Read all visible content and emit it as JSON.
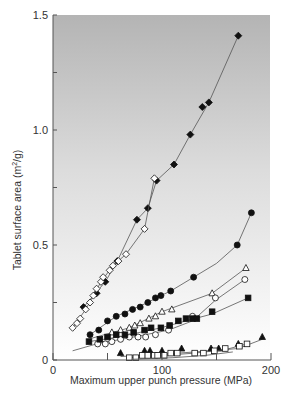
{
  "chart_data": {
    "type": "line",
    "title": "",
    "xlabel": "Maximum upper punch pressure (MPa)",
    "ylabel": "Tablet surface area (m2/g)",
    "ylabel_superscript": "2",
    "xlim": [
      0,
      200
    ],
    "ylim": [
      0,
      1.5
    ],
    "x_ticks": [
      0,
      100,
      200
    ],
    "x_minor_ticks": [
      50,
      150
    ],
    "y_ticks": [
      0,
      0.5,
      1.0,
      1.5
    ],
    "y_tick_labels": [
      "0",
      "0.5",
      "1.0",
      "1.5"
    ],
    "y_minor_ticks": [
      0.25,
      0.75,
      1.25
    ],
    "grid": false,
    "legend": null,
    "background": {
      "top": "#b4b4b4",
      "bottom": "#ffffff"
    },
    "series": [
      {
        "name": "filled-diamond",
        "marker": "diamond-filled",
        "points": [
          [
            28,
            0.23
          ],
          [
            40,
            0.29
          ],
          [
            48,
            0.34
          ],
          [
            59,
            0.43
          ],
          [
            77,
            0.61
          ],
          [
            87,
            0.66
          ],
          [
            95,
            0.78
          ],
          [
            111,
            0.85
          ],
          [
            126,
            0.98
          ],
          [
            137,
            1.1
          ],
          [
            143,
            1.12
          ],
          [
            170,
            1.41
          ]
        ],
        "line": [
          [
            28,
            0.23
          ],
          [
            48,
            0.34
          ],
          [
            59,
            0.43
          ],
          [
            77,
            0.61
          ],
          [
            87,
            0.66
          ],
          [
            95,
            0.78
          ],
          [
            111,
            0.85
          ],
          [
            126,
            0.98
          ],
          [
            143,
            1.12
          ],
          [
            170,
            1.41
          ]
        ]
      },
      {
        "name": "open-diamond",
        "marker": "diamond-open",
        "points": [
          [
            18,
            0.14
          ],
          [
            22,
            0.16
          ],
          [
            25,
            0.18
          ],
          [
            30,
            0.22
          ],
          [
            34,
            0.25
          ],
          [
            37,
            0.28
          ],
          [
            40,
            0.31
          ],
          [
            44,
            0.34
          ],
          [
            46,
            0.36
          ],
          [
            52,
            0.39
          ],
          [
            55,
            0.41
          ],
          [
            60,
            0.43
          ],
          [
            67,
            0.46
          ],
          [
            84,
            0.57
          ],
          [
            93,
            0.79
          ]
        ],
        "line": [
          [
            18,
            0.14
          ],
          [
            30,
            0.22
          ],
          [
            44,
            0.34
          ],
          [
            55,
            0.41
          ],
          [
            67,
            0.46
          ],
          [
            84,
            0.57
          ],
          [
            93,
            0.79
          ]
        ]
      },
      {
        "name": "filled-circle",
        "marker": "circle-filled",
        "points": [
          [
            34,
            0.11
          ],
          [
            42,
            0.13
          ],
          [
            50,
            0.17
          ],
          [
            58,
            0.19
          ],
          [
            66,
            0.2
          ],
          [
            73,
            0.22
          ],
          [
            80,
            0.23
          ],
          [
            87,
            0.25
          ],
          [
            94,
            0.27
          ],
          [
            99,
            0.28
          ],
          [
            108,
            0.3
          ],
          [
            129,
            0.36
          ],
          [
            169,
            0.5
          ],
          [
            182,
            0.64
          ]
        ],
        "line": [
          [
            34,
            0.11
          ],
          [
            58,
            0.19
          ],
          [
            87,
            0.25
          ],
          [
            99,
            0.28
          ],
          [
            108,
            0.3
          ],
          [
            150,
            0.42
          ],
          [
            169,
            0.5
          ],
          [
            182,
            0.64
          ]
        ]
      },
      {
        "name": "open-triangle",
        "marker": "triangle-open",
        "points": [
          [
            54,
            0.12
          ],
          [
            62,
            0.13
          ],
          [
            70,
            0.14
          ],
          [
            75,
            0.15
          ],
          [
            80,
            0.16
          ],
          [
            88,
            0.18
          ],
          [
            94,
            0.19
          ],
          [
            100,
            0.21
          ],
          [
            109,
            0.22
          ],
          [
            146,
            0.29
          ],
          [
            177,
            0.4
          ]
        ],
        "line": [
          [
            32,
            0.09
          ],
          [
            70,
            0.14
          ],
          [
            100,
            0.21
          ],
          [
            146,
            0.29
          ],
          [
            177,
            0.4
          ]
        ]
      },
      {
        "name": "open-circle",
        "marker": "circle-open",
        "points": [
          [
            41,
            0.07
          ],
          [
            48,
            0.07
          ],
          [
            54,
            0.08
          ],
          [
            62,
            0.09
          ],
          [
            70,
            0.1
          ],
          [
            78,
            0.1
          ],
          [
            85,
            0.1
          ],
          [
            94,
            0.11
          ],
          [
            106,
            0.13
          ],
          [
            128,
            0.19
          ],
          [
            149,
            0.27
          ],
          [
            176,
            0.35
          ]
        ],
        "line": [
          [
            18,
            0.04
          ],
          [
            40,
            0.07
          ],
          [
            85,
            0.11
          ],
          [
            106,
            0.13
          ],
          [
            128,
            0.17
          ],
          [
            149,
            0.26
          ],
          [
            176,
            0.35
          ]
        ]
      },
      {
        "name": "filled-square",
        "marker": "square-filled",
        "points": [
          [
            33,
            0.08
          ],
          [
            43,
            0.09
          ],
          [
            50,
            0.1
          ],
          [
            58,
            0.11
          ],
          [
            66,
            0.11
          ],
          [
            74,
            0.12
          ],
          [
            84,
            0.13
          ],
          [
            90,
            0.14
          ],
          [
            99,
            0.14
          ],
          [
            107,
            0.15
          ],
          [
            115,
            0.17
          ],
          [
            122,
            0.18
          ],
          [
            128,
            0.18
          ],
          [
            132,
            0.18
          ],
          [
            146,
            0.21
          ],
          [
            179,
            0.27
          ]
        ],
        "line": [
          [
            33,
            0.08
          ],
          [
            60,
            0.1
          ],
          [
            99,
            0.14
          ],
          [
            122,
            0.17
          ],
          [
            146,
            0.2
          ],
          [
            179,
            0.27
          ]
        ]
      },
      {
        "name": "filled-triangle",
        "marker": "triangle-filled",
        "points": [
          [
            62,
            0.03
          ],
          [
            84,
            0.04
          ],
          [
            89,
            0.04
          ],
          [
            100,
            0.04
          ],
          [
            118,
            0.05
          ],
          [
            145,
            0.05
          ],
          [
            152,
            0.05
          ],
          [
            170,
            0.07
          ],
          [
            192,
            0.1
          ]
        ],
        "line": [
          [
            62,
            0.015
          ],
          [
            100,
            0.025
          ],
          [
            145,
            0.04
          ],
          [
            170,
            0.05
          ],
          [
            192,
            0.09
          ]
        ]
      },
      {
        "name": "open-square",
        "marker": "square-open",
        "points": [
          [
            70,
            0.01
          ],
          [
            76,
            0.01
          ],
          [
            82,
            0.02
          ],
          [
            87,
            0.02
          ],
          [
            93,
            0.02
          ],
          [
            96,
            0.02
          ],
          [
            102,
            0.02
          ],
          [
            108,
            0.03
          ],
          [
            114,
            0.03
          ],
          [
            130,
            0.03
          ],
          [
            138,
            0.03
          ],
          [
            148,
            0.04
          ],
          [
            158,
            0.05
          ],
          [
            171,
            0.06
          ],
          [
            178,
            0.07
          ]
        ],
        "line": [
          [
            70,
            0.01
          ],
          [
            102,
            0.02
          ],
          [
            130,
            0.03
          ],
          [
            158,
            0.045
          ],
          [
            178,
            0.07
          ]
        ]
      },
      {
        "name": "baseline-curve",
        "marker": "none",
        "points": [],
        "line": [
          [
            72,
            0.003
          ],
          [
            110,
            0.01
          ],
          [
            140,
            0.02
          ],
          [
            165,
            0.035
          ]
        ]
      }
    ]
  }
}
